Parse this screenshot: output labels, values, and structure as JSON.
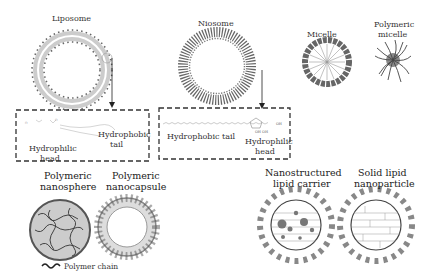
{
  "labels": {
    "liposome": "Liposome",
    "niosome": "Niosome",
    "micelle": "Micelle",
    "polymeric_micelle_1": "Polymeric",
    "polymeric_micelle_2": "micelle",
    "liposome_detail": {
      "hydrophobic_1": "Hydrophobic",
      "hydrophobic_2": "tail",
      "hydrophilic_1": "Hydrophilic",
      "hydrophilic_2": "head"
    },
    "niosome_detail": {
      "hydrophobic": "Hydrophobic tail",
      "hydrophilic_1": "Hydrophilic",
      "hydrophilic_2": "head"
    },
    "nanosphere_1": "Polymeric",
    "nanosphere_2": "nanosphere",
    "nanocapsule_1": "Polymeric",
    "nanocapsule_2": "nanocapsule",
    "nlc_1": "Nanostructured",
    "nlc_2": "lipid carrier",
    "sln_1": "Solid lipid",
    "sln_2": "nanoparticle",
    "legend_polymer_chain": "Polymer chain"
  },
  "colors": {
    "dark_gray": "#555555",
    "mid_gray": "#888888",
    "light_gray": "#bbbbbb",
    "line": "#333333"
  }
}
